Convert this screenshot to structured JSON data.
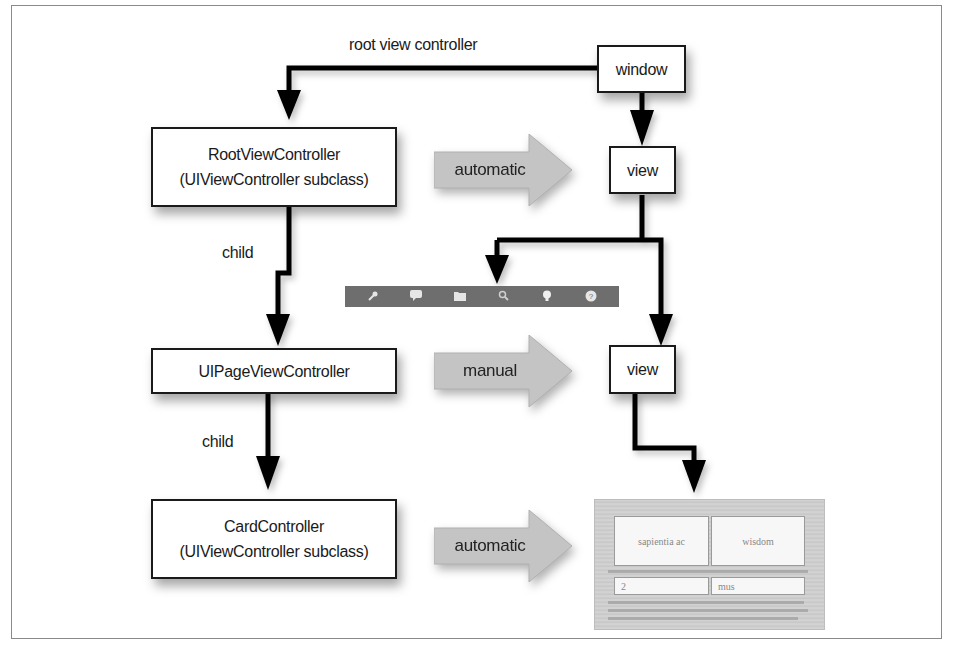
{
  "diagram": {
    "nodes": {
      "window": {
        "label": "window"
      },
      "view_top": {
        "label": "view"
      },
      "view_mid": {
        "label": "view"
      },
      "root_vc": {
        "line1": "RootViewController",
        "line2": "(UIViewController subclass)"
      },
      "page_vc": {
        "label": "UIPageViewController"
      },
      "card_vc": {
        "line1": "CardController",
        "line2": "(UIViewController subclass)"
      }
    },
    "edge_labels": {
      "root_view_controller": "root view controller",
      "child_1": "child",
      "child_2": "child"
    },
    "relation_arrows": [
      {
        "label": "automatic",
        "fill": "#c4c4c4"
      },
      {
        "label": "manual",
        "fill": "#c4c4c4"
      },
      {
        "label": "automatic",
        "fill": "#c4c4c4"
      }
    ],
    "toolbar": {
      "icons": [
        "wrench-icon",
        "speech-bubble-icon",
        "folder-icon",
        "search-icon",
        "lightbulb-icon",
        "help-icon"
      ],
      "glyphs": [
        "🔧",
        "▬",
        "▬",
        "⚲",
        "●",
        "?"
      ]
    },
    "card_preview": {
      "cells": [
        "sapientia ac",
        "wisdom",
        "2",
        "mus"
      ]
    },
    "colors": {
      "line": "#000000",
      "box_border": "#1a1a1a",
      "arrow_fill": "#c4c4c4",
      "toolbar_bg": "#6e6e6e"
    }
  }
}
